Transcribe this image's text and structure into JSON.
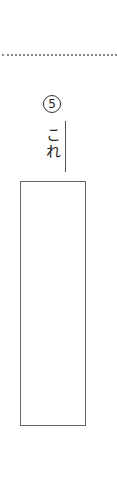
{
  "worksheet": {
    "question": {
      "number": "5",
      "number_display": "⑤",
      "term": "これ",
      "answer_value": ""
    }
  }
}
